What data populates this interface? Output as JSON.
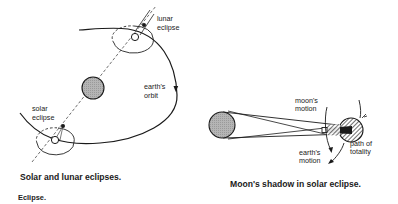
{
  "figures": [
    {
      "id": "left",
      "caption": "Solar and lunar eclipses.",
      "labels": {
        "lunar_eclipse_1": "lunar",
        "lunar_eclipse_2": "eclipse",
        "earths_orbit_1": "earth's",
        "earths_orbit_2": "orbit",
        "solar_eclipse_1": "solar",
        "solar_eclipse_2": "eclipse"
      }
    },
    {
      "id": "right",
      "caption": "Moon's shadow in solar eclipse.",
      "labels": {
        "moons_motion_1": "moon's",
        "moons_motion_2": "motion",
        "earths_motion_1": "earth's",
        "earths_motion_2": "motion",
        "path_of_totality_1": "path of",
        "path_of_totality_2": "totality"
      }
    }
  ],
  "section_label": "Eclipse.",
  "colors": {
    "sun_fill": "#b8b8b8",
    "line": "#1a1a1a",
    "background": "#ffffff"
  }
}
